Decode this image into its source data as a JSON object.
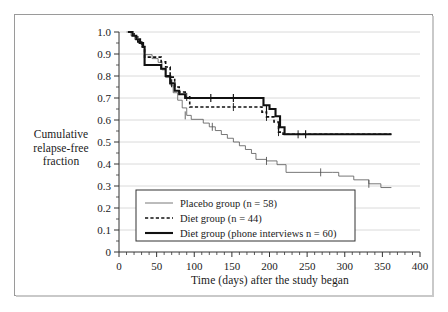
{
  "chart_data": {
    "type": "line",
    "title": "",
    "xlabel": "Time (days) after the study began",
    "ylabel": "Cumulative relapse-free fraction",
    "ylabel_lines": [
      "Cumulative",
      "relapse-free",
      "fraction"
    ],
    "xlim": [
      0,
      400
    ],
    "ylim": [
      0,
      1.0
    ],
    "xticks": [
      0,
      50,
      100,
      150,
      200,
      250,
      300,
      350,
      400
    ],
    "xtick_labels": [
      "0",
      "50",
      "100",
      "150",
      "200",
      "250",
      "300",
      "350",
      "400"
    ],
    "xminor_step": 10,
    "yticks": [
      0,
      0.1,
      0.2,
      0.3,
      0.4,
      0.5,
      0.6,
      0.7,
      0.8,
      0.9,
      1.0
    ],
    "ytick_labels": [
      "0",
      "0.1",
      "0.2",
      "0.3",
      "0.4",
      "0.5",
      "0.6",
      "0.7",
      "0.8",
      "0.9",
      "1.0"
    ],
    "yminor_step": 0.05,
    "grid": "horizontal",
    "legend_position": "lower-center",
    "series": [
      {
        "name": "Placebo group (n = 58)",
        "style": "thin-solid",
        "color": "#555555",
        "width": 0.8,
        "points": [
          [
            10,
            1.0
          ],
          [
            16,
            0.983
          ],
          [
            21,
            0.966
          ],
          [
            26,
            0.948
          ],
          [
            30,
            0.931
          ],
          [
            34,
            0.897
          ],
          [
            44,
            0.879
          ],
          [
            52,
            0.862
          ],
          [
            57,
            0.828
          ],
          [
            62,
            0.793
          ],
          [
            68,
            0.759
          ],
          [
            72,
            0.724
          ],
          [
            78,
            0.69
          ],
          [
            84,
            0.655
          ],
          [
            90,
            0.621
          ],
          [
            96,
            0.603
          ],
          [
            112,
            0.586
          ],
          [
            120,
            0.569
          ],
          [
            128,
            0.552
          ],
          [
            136,
            0.534
          ],
          [
            144,
            0.517
          ],
          [
            152,
            0.5
          ],
          [
            160,
            0.483
          ],
          [
            168,
            0.466
          ],
          [
            176,
            0.448
          ],
          [
            182,
            0.421
          ],
          [
            196,
            0.414
          ],
          [
            210,
            0.397
          ],
          [
            222,
            0.362
          ],
          [
            284,
            0.362
          ],
          [
            292,
            0.345
          ],
          [
            312,
            0.328
          ],
          [
            332,
            0.31
          ],
          [
            348,
            0.293
          ],
          [
            362,
            0.293
          ]
        ],
        "censor_marks": [
          [
            88,
            0.621
          ],
          [
            124,
            0.569
          ],
          [
            196,
            0.414
          ],
          [
            268,
            0.362
          ],
          [
            332,
            0.31
          ]
        ]
      },
      {
        "name": "Diet group (n = 44)",
        "style": "dashed",
        "color": "#111111",
        "width": 1.6,
        "points": [
          [
            14,
            1.0
          ],
          [
            20,
            0.977
          ],
          [
            25,
            0.955
          ],
          [
            30,
            0.932
          ],
          [
            34,
            0.886
          ],
          [
            52,
            0.886
          ],
          [
            56,
            0.864
          ],
          [
            62,
            0.841
          ],
          [
            68,
            0.795
          ],
          [
            74,
            0.75
          ],
          [
            80,
            0.727
          ],
          [
            88,
            0.705
          ],
          [
            94,
            0.659
          ],
          [
            182,
            0.659
          ],
          [
            190,
            0.636
          ],
          [
            196,
            0.614
          ],
          [
            206,
            0.591
          ],
          [
            212,
            0.545
          ],
          [
            218,
            0.535
          ],
          [
            362,
            0.535
          ]
        ],
        "censor_marks": [
          [
            90,
            0.705
          ],
          [
            152,
            0.659
          ],
          [
            196,
            0.614
          ],
          [
            212,
            0.545
          ],
          [
            238,
            0.535
          ]
        ]
      },
      {
        "name": "Diet group (phone interviews n = 60)",
        "style": "thick-solid",
        "color": "#111111",
        "width": 2.1,
        "points": [
          [
            12,
            1.0
          ],
          [
            18,
            0.983
          ],
          [
            23,
            0.967
          ],
          [
            28,
            0.95
          ],
          [
            32,
            0.933
          ],
          [
            34,
            0.85
          ],
          [
            52,
            0.85
          ],
          [
            56,
            0.833
          ],
          [
            62,
            0.8
          ],
          [
            68,
            0.767
          ],
          [
            74,
            0.733
          ],
          [
            80,
            0.717
          ],
          [
            88,
            0.7
          ],
          [
            182,
            0.7
          ],
          [
            192,
            0.667
          ],
          [
            200,
            0.65
          ],
          [
            208,
            0.617
          ],
          [
            214,
            0.567
          ],
          [
            220,
            0.535
          ],
          [
            362,
            0.535
          ]
        ],
        "censor_marks": [
          [
            70,
            0.767
          ],
          [
            122,
            0.7
          ],
          [
            152,
            0.7
          ],
          [
            196,
            0.65
          ],
          [
            212,
            0.567
          ],
          [
            248,
            0.535
          ]
        ]
      }
    ]
  },
  "legend": {
    "entries": [
      {
        "label": "Placebo group (n = 58)",
        "style": "thin-solid"
      },
      {
        "label": "Diet group (n = 44)",
        "style": "dashed"
      },
      {
        "label": "Diet group (phone interviews n = 60)",
        "style": "thick-solid"
      }
    ]
  },
  "caption": {
    "sliver": ""
  }
}
